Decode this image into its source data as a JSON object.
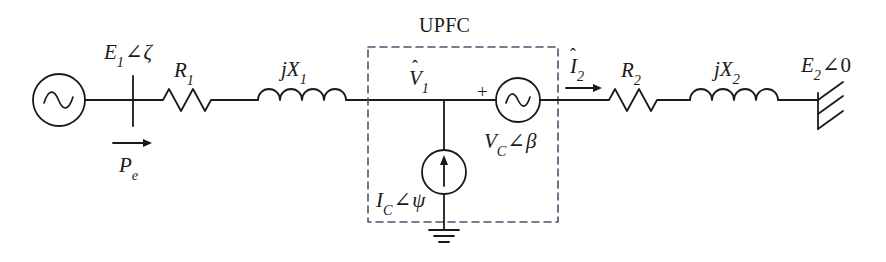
{
  "diagram": {
    "type": "electrical-schematic",
    "line_color": "#1a1a1a",
    "background": "#ffffff",
    "dash_color": "#4a4a6a"
  },
  "labels": {
    "source_voltage": {
      "base": "E",
      "sub": "1",
      "angle": "∠",
      "phase": "ζ"
    },
    "power_flow": {
      "base": "P",
      "sub": "e"
    },
    "resistor_1": {
      "base": "R",
      "sub": "1"
    },
    "reactance_1": {
      "prefix": "j",
      "base": "X",
      "sub": "1"
    },
    "node_voltage_1": {
      "base": "V",
      "sub": "1",
      "hat": "ˆ"
    },
    "upfc_box": "UPFC",
    "shunt_current": {
      "base": "I",
      "sub": "C",
      "angle": "∠",
      "phase": "ψ"
    },
    "series_voltage": {
      "base": "V",
      "sub": "C",
      "angle": "∠",
      "phase": "β"
    },
    "series_polarity": "+",
    "line_current_2": {
      "base": "I",
      "sub": "2",
      "hat": "ˆ"
    },
    "resistor_2": {
      "base": "R",
      "sub": "2"
    },
    "reactance_2": {
      "prefix": "j",
      "base": "X",
      "sub": "2"
    },
    "infinite_bus": {
      "base": "E",
      "sub": "2",
      "angle": "∠",
      "phase": "0"
    }
  },
  "components": [
    {
      "name": "ac-voltage-source-1",
      "kind": "ac-source",
      "label": "E1∠ζ"
    },
    {
      "name": "bus-bar-1",
      "kind": "bus"
    },
    {
      "name": "power-flow-arrow",
      "kind": "arrow",
      "label": "Pe"
    },
    {
      "name": "resistor-r1",
      "kind": "resistor",
      "label": "R1"
    },
    {
      "name": "inductor-jx1",
      "kind": "inductor",
      "label": "jX1"
    },
    {
      "name": "upfc-enclosure",
      "kind": "dashed-box",
      "label": "UPFC"
    },
    {
      "name": "shunt-current-source",
      "kind": "current-source",
      "label": "IC∠ψ"
    },
    {
      "name": "ground-symbol",
      "kind": "ground"
    },
    {
      "name": "series-voltage-source",
      "kind": "ac-source",
      "label": "VC∠β"
    },
    {
      "name": "line-current-arrow-2",
      "kind": "arrow",
      "label": "I2"
    },
    {
      "name": "resistor-r2",
      "kind": "resistor",
      "label": "R2"
    },
    {
      "name": "inductor-jx2",
      "kind": "inductor",
      "label": "jX2"
    },
    {
      "name": "infinite-bus-symbol",
      "kind": "infinite-bus",
      "label": "E2∠0"
    }
  ]
}
